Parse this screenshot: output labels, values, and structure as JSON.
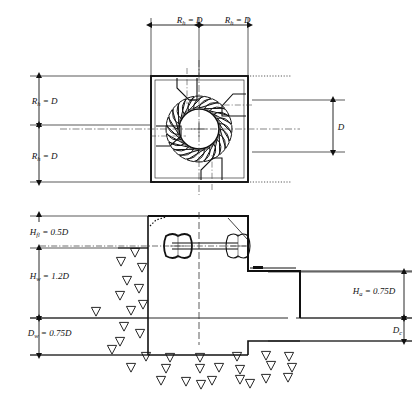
{
  "figure": {
    "type": "engineering-drawing",
    "views": [
      {
        "id": "plan",
        "name": "plan-view",
        "description": "top view of square sump with circular impeller, radial vanes and four tapered inlet channels"
      },
      {
        "id": "section",
        "name": "section-view",
        "description": "vertical section of intake structure with shaft, pulleys, water levels and soil"
      }
    ],
    "colors": {
      "line": "#111111",
      "background": "#ffffff",
      "centerline": "#333333"
    }
  },
  "plan_view": {
    "dimensions": {
      "top_left": {
        "label_var": "R",
        "label_sub": "h",
        "label_eq": " = D",
        "full": "Rh = D"
      },
      "top_right": {
        "label_var": "R",
        "label_sub": "h",
        "label_eq": " = D",
        "full": "Rh = D"
      },
      "left_upper": {
        "label_var": "R",
        "label_sub": "h",
        "label_eq": " = D",
        "full": "Rh = D"
      },
      "left_lower": {
        "label_var": "R",
        "label_sub": "h",
        "label_eq": " = D",
        "full": "Rh = D"
      },
      "right": {
        "label_var": "D",
        "label_sub": "",
        "label_eq": "",
        "full": "D"
      }
    },
    "impeller": {
      "vane_count": 24,
      "hub_label": "",
      "inlet_channel_count": 4
    }
  },
  "section_view": {
    "dimensions": {
      "h_fl": {
        "label_var": "H",
        "label_sub": "fl",
        "label_eq": " = 0.5D",
        "full": "Hfl = 0.5D"
      },
      "h_w": {
        "label_var": "H",
        "label_sub": "w",
        "label_eq": " = 1.2D",
        "full": "Hw = 1.2D"
      },
      "d_w": {
        "label_var": "D",
        "label_sub": "w",
        "label_eq": " = 0.75D",
        "full": "Dw = 0.75D"
      },
      "h_a": {
        "label_var": "H",
        "label_sub": "a",
        "label_eq": " = 0.75D",
        "full": "Ha = 0.75D"
      },
      "d_c": {
        "label_var": "D",
        "label_sub": "c",
        "label_eq": "",
        "full": "Dc"
      }
    },
    "machinery": {
      "pulley_left": "drive-pulley",
      "pulley_right": "driven-pulley",
      "shaft": "horizontal-shaft"
    },
    "soil_symbol_count": 34
  }
}
